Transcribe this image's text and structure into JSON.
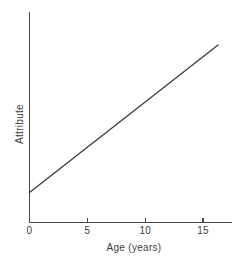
{
  "chart_data": {
    "type": "line",
    "title": "",
    "xlabel": "Age (years)",
    "ylabel": "Attribute",
    "xlim": [
      0,
      17.5
    ],
    "ylim": [
      0,
      1
    ],
    "grid": false,
    "legend": null,
    "xticks": [
      {
        "value": 0,
        "label": "0"
      },
      {
        "value": 5,
        "label": "5"
      },
      {
        "value": 10,
        "label": "10"
      },
      {
        "value": 15,
        "label": "15"
      }
    ],
    "yticks": [],
    "series": [
      {
        "name": "Attribute",
        "color": "#3b3b3b",
        "x": [
          0,
          16.3
        ],
        "y": [
          0.143,
          0.843
        ]
      }
    ],
    "annotations": []
  },
  "figure": {
    "background_color": "#ffffff",
    "axis_color": "#4a4a4a",
    "text_color": "#3d3d3d"
  }
}
